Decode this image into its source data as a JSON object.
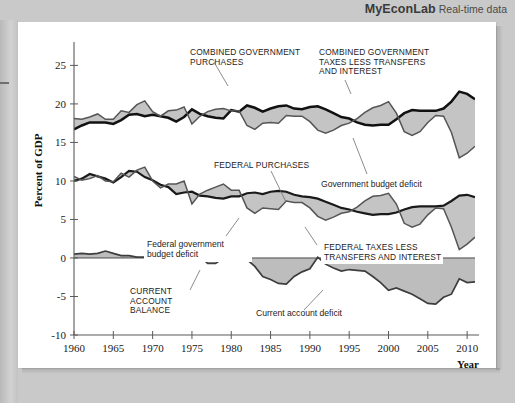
{
  "brand": {
    "name": "MyEconLab",
    "tagline": "Real-time data"
  },
  "chart_data": {
    "type": "area",
    "title": "",
    "xlabel": "Year",
    "ylabel": "Percent of GDP",
    "xlim": [
      1960,
      2011
    ],
    "ylim": [
      -10,
      27
    ],
    "yticks": [
      -10,
      -5,
      0,
      5,
      10,
      15,
      20,
      25
    ],
    "ytick_labels": [
      "-10",
      "-5",
      "0",
      "5",
      "10",
      "15",
      "20",
      "25"
    ],
    "xticks": [
      1960,
      1965,
      1970,
      1975,
      1980,
      1985,
      1990,
      1995,
      2000,
      2005,
      2010
    ],
    "xtick_labels": [
      "1960",
      "1965",
      "1970",
      "1975",
      "1980",
      "1985",
      "1990",
      "1995",
      "2000",
      "2005",
      "2010"
    ],
    "grid": false,
    "legend_position": "inline-annotations",
    "x": [
      1960,
      1961,
      1962,
      1963,
      1964,
      1965,
      1966,
      1967,
      1968,
      1969,
      1970,
      1971,
      1972,
      1973,
      1974,
      1975,
      1976,
      1977,
      1978,
      1979,
      1980,
      1981,
      1982,
      1983,
      1984,
      1985,
      1986,
      1987,
      1988,
      1989,
      1990,
      1991,
      1992,
      1993,
      1994,
      1995,
      1996,
      1997,
      1998,
      1999,
      2000,
      2001,
      2002,
      2003,
      2004,
      2005,
      2006,
      2007,
      2008,
      2009,
      2010,
      2011
    ],
    "series": [
      {
        "name": "COMBINED GOVERNMENT PURCHASES",
        "style": "line-bold",
        "values": [
          16.7,
          17.2,
          17.6,
          17.6,
          17.6,
          17.4,
          17.9,
          18.6,
          18.7,
          18.4,
          18.6,
          18.4,
          18.2,
          17.7,
          18.3,
          19.3,
          18.7,
          18.4,
          18.2,
          18.1,
          19.2,
          19.0,
          19.8,
          19.5,
          19.0,
          19.4,
          19.7,
          19.8,
          19.4,
          19.3,
          19.6,
          19.7,
          19.3,
          18.8,
          18.3,
          18.1,
          17.6,
          17.3,
          17.2,
          17.3,
          17.3,
          18.0,
          18.8,
          19.2,
          19.1,
          19.1,
          19.1,
          19.4,
          20.3,
          21.6,
          21.3,
          20.6
        ]
      },
      {
        "name": "COMBINED GOVERNMENT TAXES LESS TRANSFERS AND INTEREST",
        "style": "line-thin",
        "values": [
          18.1,
          18.0,
          18.3,
          18.7,
          18.0,
          18.0,
          19.1,
          18.9,
          19.9,
          20.4,
          19.0,
          18.4,
          19.1,
          19.2,
          19.6,
          17.4,
          18.4,
          19.0,
          19.3,
          19.4,
          19.1,
          19.1,
          17.2,
          16.7,
          17.5,
          17.6,
          17.5,
          18.5,
          18.4,
          18.4,
          17.7,
          16.6,
          16.2,
          16.6,
          17.2,
          17.5,
          18.1,
          18.9,
          19.5,
          19.8,
          20.3,
          18.8,
          16.4,
          15.9,
          16.4,
          17.6,
          18.5,
          18.4,
          16.3,
          13.0,
          13.6,
          14.5
        ]
      },
      {
        "name": "FEDERAL PURCHASES",
        "style": "line-bold2",
        "values": [
          10.0,
          10.3,
          10.9,
          10.6,
          10.3,
          9.8,
          10.5,
          11.3,
          11.2,
          10.5,
          10.1,
          9.5,
          9.2,
          8.3,
          8.5,
          8.6,
          8.1,
          8.0,
          7.8,
          7.7,
          8.0,
          8.0,
          8.4,
          8.5,
          8.3,
          8.6,
          8.7,
          8.6,
          8.2,
          8.0,
          7.9,
          7.7,
          7.3,
          6.9,
          6.5,
          6.3,
          6.0,
          5.8,
          5.6,
          5.7,
          5.7,
          5.9,
          6.3,
          6.6,
          6.7,
          6.7,
          6.7,
          6.8,
          7.4,
          8.1,
          8.2,
          7.9
        ]
      },
      {
        "name": "FEDERAL TAXES LESS TRANSFERS AND INTEREST",
        "style": "line-thin",
        "values": [
          10.6,
          10.1,
          10.3,
          10.7,
          10.0,
          9.9,
          11.0,
          10.5,
          11.4,
          11.8,
          10.0,
          9.1,
          9.6,
          9.6,
          10.0,
          7.0,
          8.3,
          8.8,
          9.2,
          9.6,
          8.8,
          8.8,
          6.5,
          5.8,
          6.5,
          6.4,
          6.3,
          7.4,
          7.2,
          7.2,
          6.5,
          5.4,
          4.9,
          5.3,
          5.8,
          6.0,
          6.6,
          7.4,
          8.0,
          8.1,
          8.4,
          7.0,
          4.5,
          4.0,
          4.4,
          5.6,
          6.5,
          6.4,
          4.0,
          1.1,
          1.8,
          2.7
        ]
      },
      {
        "name": "CURRENT ACCOUNT BALANCE",
        "style": "line-med",
        "values": [
          0.5,
          0.6,
          0.5,
          0.6,
          0.9,
          0.6,
          0.3,
          0.3,
          0.1,
          0.1,
          0.2,
          0.0,
          -0.4,
          0.4,
          0.1,
          1.0,
          0.2,
          -0.7,
          -0.7,
          0.0,
          0.1,
          0.2,
          -0.2,
          -1.1,
          -2.4,
          -2.8,
          -3.3,
          -3.4,
          -2.4,
          -1.8,
          -1.4,
          0.1,
          -0.8,
          -1.3,
          -1.7,
          -1.5,
          -1.6,
          -1.7,
          -2.4,
          -3.2,
          -4.2,
          -3.9,
          -4.3,
          -4.7,
          -5.3,
          -5.9,
          -6.0,
          -5.1,
          -4.7,
          -2.7,
          -3.2,
          -3.1
        ]
      }
    ],
    "shaded_bands": [
      {
        "name": "Government budget deficit",
        "between": [
          "COMBINED GOVERNMENT PURCHASES",
          "COMBINED GOVERNMENT TAXES LESS TRANSFERS AND INTEREST"
        ],
        "fill": "#c4c4c4"
      },
      {
        "name": "Federal government budget deficit",
        "between": [
          "FEDERAL PURCHASES",
          "FEDERAL TAXES LESS TRANSFERS AND INTEREST"
        ],
        "fill": "#c4c4c4"
      },
      {
        "name": "Current account deficit",
        "between": [
          "CURRENT ACCOUNT BALANCE",
          "zero"
        ],
        "fill": "#bdbdbd"
      }
    ],
    "annotations": [
      {
        "id": "a1",
        "text": "COMBINED GOVERNMENT\nPURCHASES",
        "style": "caps"
      },
      {
        "id": "a2",
        "text": "COMBINED GOVERNMENT\nTAXES LESS TRANSFERS\nAND INTEREST",
        "style": "caps"
      },
      {
        "id": "a3",
        "text": "FEDERAL PURCHASES",
        "style": "caps"
      },
      {
        "id": "a4",
        "text": "Government budget deficit",
        "style": "mixed"
      },
      {
        "id": "a5",
        "text": "Federal government\nbudget deficit",
        "style": "mixed"
      },
      {
        "id": "a6",
        "text": "FEDERAL TAXES LESS\nTRANSFERS AND INTEREST",
        "style": "caps"
      },
      {
        "id": "a7",
        "text": "CURRENT\nACCOUNT\nBALANCE",
        "style": "caps"
      },
      {
        "id": "a8",
        "text": "Current account deficit",
        "style": "mixed"
      }
    ]
  },
  "labels": {
    "anno1_l1": "COMBINED GOVERNMENT",
    "anno1_l2": "PURCHASES",
    "anno2_l1": "COMBINED GOVERNMENT",
    "anno2_l2": "TAXES LESS TRANSFERS",
    "anno2_l3": "AND INTEREST",
    "anno3": "FEDERAL PURCHASES",
    "anno4": "Government budget deficit",
    "anno5_l1": "Federal government",
    "anno5_l2": "budget deficit",
    "anno6_l1": "FEDERAL TAXES LESS",
    "anno6_l2": "TRANSFERS AND INTEREST",
    "anno7_l1": "CURRENT",
    "anno7_l2": "ACCOUNT",
    "anno7_l3": "BALANCE",
    "anno8": "Current account deficit",
    "ylabel": "Percent of GDP",
    "xlabel": "Year"
  }
}
